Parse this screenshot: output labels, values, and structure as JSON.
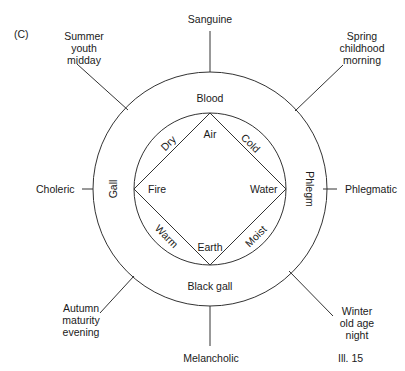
{
  "figure": {
    "panel_label": "(C)",
    "caption": "Ill. 15"
  },
  "temperaments": {
    "top": "Sanguine",
    "left": "Choleric",
    "right": "Phlegmatic",
    "bottom": "Melancholic"
  },
  "seasons": {
    "top_left": [
      "Summer",
      "youth",
      "midday"
    ],
    "top_right": [
      "Spring",
      "childhood",
      "morning"
    ],
    "bottom_left": [
      "Autumn",
      "maturity",
      "evening"
    ],
    "bottom_right": [
      "Winter",
      "old age",
      "night"
    ]
  },
  "humours": {
    "top": "Blood",
    "left": "Gall",
    "right": "Phlegm",
    "bottom": "Black gall"
  },
  "elements": {
    "top": "Air",
    "left": "Fire",
    "right": "Water",
    "bottom": "Earth"
  },
  "qualities": {
    "top_left": "Dry",
    "top_right": "Cold",
    "bottom_left": "Warm",
    "bottom_right": "Moist"
  }
}
